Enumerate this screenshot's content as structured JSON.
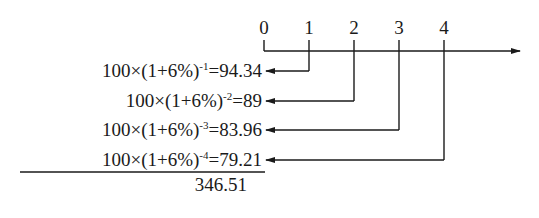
{
  "timeline": {
    "ticks": [
      "0",
      "1",
      "2",
      "3",
      "4"
    ],
    "axis_color": "#1a1a1a"
  },
  "rows": [
    {
      "base": "100×(1+6%)",
      "exp": "-1",
      "result": "=94.34",
      "period": "1"
    },
    {
      "base": "100×(1+6%)",
      "exp": "-2",
      "result": "=89",
      "period": "2"
    },
    {
      "base": "100×(1+6%)",
      "exp": "-3",
      "result": "=83.96",
      "period": "3"
    },
    {
      "base": "100×(1+6%)",
      "exp": "-4",
      "result": "=79.21",
      "period": "4"
    }
  ],
  "total": "346.51"
}
